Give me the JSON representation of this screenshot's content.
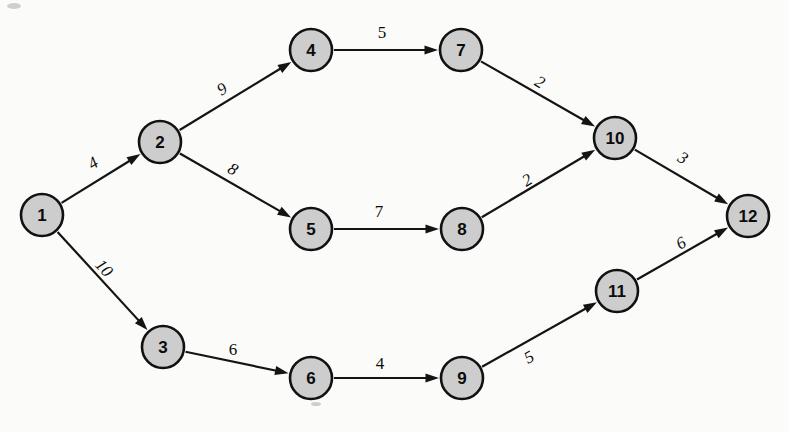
{
  "diagram": {
    "type": "directed-weighted-graph",
    "node_radius": 21,
    "colors": {
      "node_fill": "#cdcdcd",
      "node_stroke": "#111111",
      "edge_stroke": "#141414",
      "background": "#fbfbf9",
      "label_color": "#0b0b0b"
    },
    "nodes": [
      {
        "id": "1",
        "label": "1",
        "x": 42,
        "y": 215
      },
      {
        "id": "2",
        "label": "2",
        "x": 160,
        "y": 142
      },
      {
        "id": "3",
        "label": "3",
        "x": 163,
        "y": 347
      },
      {
        "id": "4",
        "label": "4",
        "x": 311,
        "y": 50
      },
      {
        "id": "5",
        "label": "5",
        "x": 311,
        "y": 229
      },
      {
        "id": "6",
        "label": "6",
        "x": 311,
        "y": 378
      },
      {
        "id": "7",
        "label": "7",
        "x": 461,
        "y": 50
      },
      {
        "id": "8",
        "label": "8",
        "x": 462,
        "y": 229
      },
      {
        "id": "9",
        "label": "9",
        "x": 462,
        "y": 378
      },
      {
        "id": "10",
        "label": "10",
        "x": 615,
        "y": 138
      },
      {
        "id": "11",
        "label": "11",
        "x": 617,
        "y": 291
      },
      {
        "id": "12",
        "label": "12",
        "x": 748,
        "y": 216
      }
    ],
    "edges": [
      {
        "from": "1",
        "to": "2",
        "weight": "4",
        "label_x": 93,
        "label_y": 163,
        "slanted": true
      },
      {
        "from": "1",
        "to": "3",
        "weight": "10",
        "label_x": 104,
        "label_y": 268,
        "slanted": true
      },
      {
        "from": "2",
        "to": "4",
        "weight": "9",
        "label_x": 222,
        "label_y": 89,
        "slanted": true
      },
      {
        "from": "2",
        "to": "5",
        "weight": "8",
        "label_x": 233,
        "label_y": 169,
        "slanted": true
      },
      {
        "from": "3",
        "to": "6",
        "weight": "6",
        "label_x": 233,
        "label_y": 349,
        "slanted": false
      },
      {
        "from": "4",
        "to": "7",
        "weight": "5",
        "label_x": 382,
        "label_y": 32,
        "slanted": false
      },
      {
        "from": "5",
        "to": "8",
        "weight": "7",
        "label_x": 379,
        "label_y": 211,
        "slanted": false
      },
      {
        "from": "6",
        "to": "9",
        "weight": "4",
        "label_x": 380,
        "label_y": 363,
        "slanted": false
      },
      {
        "from": "7",
        "to": "10",
        "weight": "2",
        "label_x": 540,
        "label_y": 82,
        "slanted": true
      },
      {
        "from": "8",
        "to": "10",
        "weight": "2",
        "label_x": 527,
        "label_y": 180,
        "slanted": true
      },
      {
        "from": "9",
        "to": "11",
        "weight": "5",
        "label_x": 529,
        "label_y": 357,
        "slanted": true
      },
      {
        "from": "10",
        "to": "12",
        "weight": "3",
        "label_x": 683,
        "label_y": 158,
        "slanted": true
      },
      {
        "from": "11",
        "to": "12",
        "weight": "6",
        "label_x": 681,
        "label_y": 243,
        "slanted": true
      }
    ]
  }
}
